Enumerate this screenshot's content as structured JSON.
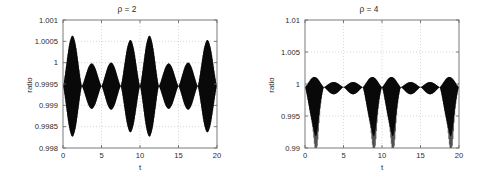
{
  "figure": {
    "background_color": "#ffffff",
    "axis_color": "#6e6e6e",
    "grid_color": "#c9c9c9",
    "trace_color": "#0b0b0b",
    "panel_count": 2
  },
  "chart_data": [
    {
      "type": "line",
      "panel": "left",
      "title": "ρ = 2",
      "xlabel": "t",
      "ylabel": "ratio",
      "xlim": [
        0,
        20
      ],
      "ylim": [
        0.998,
        1.001
      ],
      "xticks": [
        0,
        5,
        10,
        15,
        20
      ],
      "xticklabels": [
        "0",
        "5",
        "10",
        "15",
        "20"
      ],
      "yticks": [
        0.998,
        0.9985,
        0.999,
        0.9995,
        1,
        1.0005,
        1.001
      ],
      "yticklabels": [
        "0.998",
        "0.9985",
        "0.999",
        "0.9995",
        "1",
        "1.0005",
        "1.001"
      ],
      "grid": true,
      "legend": null,
      "description": "Dense high-frequency oscillation about a mean ratio of 0.99945 whose amplitude is modulated by a beating envelope with period 10 in t; envelope is symmetric about the mean.",
      "series": [
        {
          "name": "ratio",
          "mean": 0.99945,
          "carrier_cycles": 260,
          "envelope_symmetric": true,
          "envelope_period": 10,
          "envelope_nodes_t": [
            0.0,
            2.45,
            5.0,
            7.5,
            10.0,
            12.45,
            15.0,
            17.5,
            20.0
          ],
          "envelope_lobes": [
            {
              "center_t": 1.25,
              "half_amplitude": 0.00118
            },
            {
              "center_t": 3.65,
              "half_amplitude": 0.00053
            },
            {
              "center_t": 6.3,
              "half_amplitude": 0.00055
            },
            {
              "center_t": 8.85,
              "half_amplitude": 0.00108
            },
            {
              "center_t": 11.25,
              "half_amplitude": 0.00118
            },
            {
              "center_t": 13.65,
              "half_amplitude": 0.00053
            },
            {
              "center_t": 16.3,
              "half_amplitude": 0.00055
            },
            {
              "center_t": 18.85,
              "half_amplitude": 0.00108
            }
          ]
        }
      ]
    },
    {
      "type": "line",
      "panel": "right",
      "title": "ρ = 4",
      "xlabel": "t",
      "ylabel": "ratio",
      "xlim": [
        0,
        20
      ],
      "ylim": [
        0.99,
        1.01
      ],
      "xticks": [
        0,
        5,
        10,
        15,
        20
      ],
      "xticklabels": [
        "0",
        "5",
        "10",
        "15",
        "20"
      ],
      "yticks": [
        0.99,
        0.995,
        1,
        1.005,
        1.01
      ],
      "yticklabels": [
        "0.99",
        "0.995",
        "1",
        "1.005",
        "1.01"
      ],
      "grid": true,
      "legend": null,
      "description": "Dense high-frequency oscillation about a mean ratio of 0.9995 with a beating envelope of period 10; the envelope is asymmetric, with narrow downward spikes reaching about 0.9935 after each large lobe.",
      "series": [
        {
          "name": "ratio",
          "mean": 0.9995,
          "carrier_cycles": 260,
          "envelope_symmetric": false,
          "envelope_period": 10,
          "envelope_nodes_t": [
            0.0,
            2.45,
            5.0,
            7.5,
            10.0,
            12.45,
            15.0,
            17.5,
            20.0
          ],
          "envelope_lobes": [
            {
              "center_t": 1.3,
              "up_amplitude": 0.0016,
              "down_amplitude": 0.0058
            },
            {
              "center_t": 3.6,
              "up_amplitude": 0.0008,
              "down_amplitude": 0.0011
            },
            {
              "center_t": 6.4,
              "up_amplitude": 0.0008,
              "down_amplitude": 0.0011
            },
            {
              "center_t": 8.85,
              "up_amplitude": 0.0016,
              "down_amplitude": 0.0058
            },
            {
              "center_t": 11.3,
              "up_amplitude": 0.0016,
              "down_amplitude": 0.0058
            },
            {
              "center_t": 13.6,
              "up_amplitude": 0.0008,
              "down_amplitude": 0.0011
            },
            {
              "center_t": 16.4,
              "up_amplitude": 0.0008,
              "down_amplitude": 0.0011
            },
            {
              "center_t": 18.85,
              "up_amplitude": 0.0016,
              "down_amplitude": 0.0058
            }
          ]
        }
      ]
    }
  ]
}
